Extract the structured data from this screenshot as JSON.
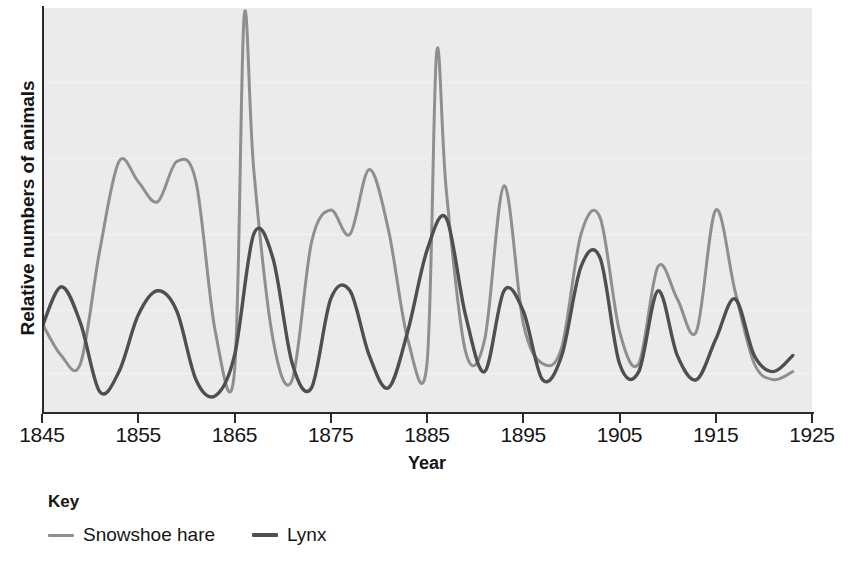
{
  "chart_data": {
    "type": "line",
    "title": "",
    "xlabel": "Year",
    "ylabel": "Relative numbers of animals",
    "xlim": [
      1845,
      1925
    ],
    "ylim": [
      0,
      100
    ],
    "grid": false,
    "legend_position": "bottom-left",
    "legend_title": "Key",
    "xticks": [
      1845,
      1855,
      1865,
      1875,
      1885,
      1895,
      1905,
      1915,
      1925
    ],
    "xticklabels": [
      "1845",
      "1855",
      "1865",
      "1875",
      "1885",
      "1895",
      "1905",
      "1915",
      "1925"
    ],
    "yticks": [],
    "yticklabels": [],
    "colors": {
      "snowshoe_hare": "#8f8f8f",
      "lynx": "#4f4f4f",
      "plot_background": "#ebebeb",
      "axis": "#2b2b2b",
      "text": "#151515"
    },
    "series": [
      {
        "name": "Snowshoe hare",
        "color": "#8f8f8f",
        "x": [
          1845,
          1847,
          1849,
          1851,
          1853,
          1855,
          1857,
          1859,
          1861,
          1863,
          1865,
          1866,
          1867,
          1869,
          1871,
          1873,
          1875,
          1877,
          1879,
          1881,
          1883,
          1885,
          1886,
          1887,
          1889,
          1891,
          1893,
          1895,
          1897,
          1899,
          1901,
          1903,
          1905,
          1907,
          1909,
          1911,
          1913,
          1915,
          1917,
          1919,
          1921,
          1923
        ],
        "y": [
          22,
          14,
          12,
          40,
          62,
          57,
          52,
          62,
          57,
          20,
          10,
          98,
          60,
          18,
          8,
          42,
          50,
          44,
          60,
          45,
          18,
          12,
          89,
          55,
          15,
          18,
          56,
          22,
          12,
          16,
          44,
          48,
          20,
          12,
          36,
          28,
          20,
          50,
          30,
          12,
          8,
          10
        ],
        "peaks": [
          {
            "year": 1866,
            "value": 98,
            "note": "highest hare peak"
          },
          {
            "year": 1886,
            "value": 89,
            "note": "second highest hare peak"
          }
        ]
      },
      {
        "name": "Lynx",
        "color": "#4f4f4f",
        "x": [
          1845,
          1847,
          1849,
          1851,
          1853,
          1855,
          1857,
          1859,
          1861,
          1863,
          1865,
          1867,
          1869,
          1871,
          1873,
          1875,
          1877,
          1879,
          1881,
          1883,
          1885,
          1887,
          1889,
          1891,
          1893,
          1895,
          1897,
          1899,
          1901,
          1903,
          1905,
          1907,
          1909,
          1911,
          1913,
          1915,
          1917,
          1919,
          1921,
          1923
        ],
        "y": [
          21,
          31,
          22,
          5,
          10,
          24,
          30,
          25,
          8,
          4,
          14,
          44,
          38,
          12,
          6,
          28,
          30,
          14,
          6,
          20,
          40,
          48,
          24,
          10,
          30,
          25,
          8,
          14,
          36,
          38,
          12,
          10,
          30,
          14,
          8,
          18,
          28,
          14,
          10,
          14
        ]
      }
    ]
  },
  "axis": {
    "ylabel": "Relative numbers of animals",
    "xlabel": "Year"
  },
  "legend": {
    "title": "Key",
    "entries": [
      {
        "label": "Snowshoe hare",
        "color": "#8f8f8f"
      },
      {
        "label": "Lynx",
        "color": "#4f4f4f"
      }
    ]
  }
}
